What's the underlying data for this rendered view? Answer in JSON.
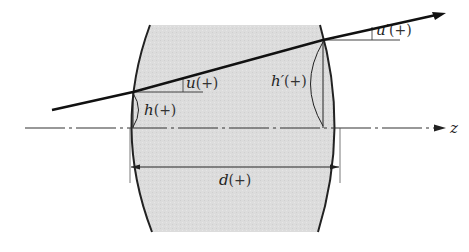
{
  "diagram": {
    "axis": {
      "label": "z",
      "style": "dash-dot"
    },
    "lens": {
      "fill_color": "#dcdcdc",
      "stroke_color": "#222222"
    },
    "ray": {
      "color": "#111111",
      "direction": "left-to-right",
      "has_arrow": true
    },
    "labels": {
      "u": {
        "symbol": "u",
        "sign": "(+)"
      },
      "u_prime": {
        "symbol": "u′",
        "sign": "(+)"
      },
      "h": {
        "symbol": "h",
        "sign": "(+)"
      },
      "h_prime": {
        "symbol": "h′",
        "sign": "(+)"
      },
      "d": {
        "symbol": "d",
        "sign": "(+)"
      }
    }
  }
}
